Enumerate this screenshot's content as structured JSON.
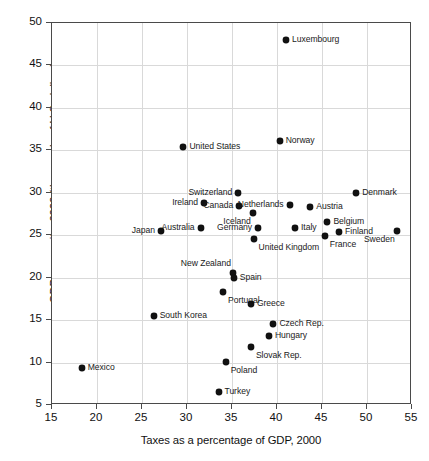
{
  "chart_data": {
    "type": "scatter",
    "title": "",
    "xlabel": "Taxes as a percentage of GDP, 2000",
    "ylabel": "GDP per capita, 2000 (thousands of U.S. dollars)",
    "xlim": [
      15,
      55
    ],
    "ylim": [
      5,
      50
    ],
    "xticks": [
      15,
      20,
      25,
      30,
      35,
      40,
      45,
      50,
      55
    ],
    "yticks": [
      5,
      10,
      15,
      20,
      25,
      30,
      35,
      40,
      45,
      50
    ],
    "grid": true,
    "legend": "none",
    "marker_color": "#111111",
    "points": [
      {
        "label": "Luxembourg",
        "x": 41.0,
        "y": 48.0,
        "pos": "right"
      },
      {
        "label": "Norway",
        "x": 40.3,
        "y": 36.1,
        "pos": "right"
      },
      {
        "label": "United States",
        "x": 29.6,
        "y": 35.4,
        "pos": "right"
      },
      {
        "label": "Switzerland",
        "x": 35.7,
        "y": 30.0,
        "pos": "left"
      },
      {
        "label": "Denmark",
        "x": 48.8,
        "y": 30.0,
        "pos": "right"
      },
      {
        "label": "Ireland",
        "x": 31.9,
        "y": 28.8,
        "pos": "left"
      },
      {
        "label": "Canada",
        "x": 35.8,
        "y": 28.5,
        "pos": "left"
      },
      {
        "label": "Netherlands",
        "x": 41.4,
        "y": 28.6,
        "pos": "left"
      },
      {
        "label": "Austria",
        "x": 43.7,
        "y": 28.3,
        "pos": "right"
      },
      {
        "label": "Iceland",
        "x": 37.3,
        "y": 27.6,
        "pos": "below-left"
      },
      {
        "label": "Belgium",
        "x": 45.6,
        "y": 26.6,
        "pos": "right"
      },
      {
        "label": "Australia",
        "x": 31.5,
        "y": 25.9,
        "pos": "left"
      },
      {
        "label": "Germany",
        "x": 37.9,
        "y": 25.9,
        "pos": "left"
      },
      {
        "label": "Italy",
        "x": 42.0,
        "y": 25.8,
        "pos": "right"
      },
      {
        "label": "Finland",
        "x": 46.9,
        "y": 25.4,
        "pos": "right"
      },
      {
        "label": "Japan",
        "x": 27.1,
        "y": 25.5,
        "pos": "left"
      },
      {
        "label": "Sweden",
        "x": 53.3,
        "y": 25.5,
        "pos": "below-left"
      },
      {
        "label": "France",
        "x": 45.3,
        "y": 24.9,
        "pos": "below"
      },
      {
        "label": "United Kingdom",
        "x": 37.4,
        "y": 24.6,
        "pos": "below"
      },
      {
        "label": "New Zealand",
        "x": 35.1,
        "y": 20.5,
        "pos": "above-left"
      },
      {
        "label": "Spain",
        "x": 35.2,
        "y": 20.0,
        "pos": "right"
      },
      {
        "label": "Portugal",
        "x": 34.0,
        "y": 18.3,
        "pos": "below"
      },
      {
        "label": "Greece",
        "x": 37.1,
        "y": 16.9,
        "pos": "right"
      },
      {
        "label": "South Korea",
        "x": 26.3,
        "y": 15.5,
        "pos": "right"
      },
      {
        "label": "Czech Rep.",
        "x": 39.6,
        "y": 14.5,
        "pos": "right"
      },
      {
        "label": "Hungary",
        "x": 39.1,
        "y": 13.1,
        "pos": "right"
      },
      {
        "label": "Slovak Rep.",
        "x": 37.1,
        "y": 11.8,
        "pos": "below"
      },
      {
        "label": "Poland",
        "x": 34.3,
        "y": 10.1,
        "pos": "below"
      },
      {
        "label": "Mexico",
        "x": 18.3,
        "y": 9.3,
        "pos": "right"
      },
      {
        "label": "Turkey",
        "x": 33.5,
        "y": 6.5,
        "pos": "right"
      }
    ]
  }
}
